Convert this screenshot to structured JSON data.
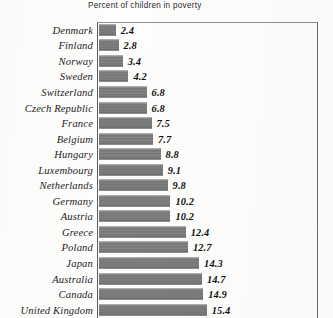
{
  "chart_data": {
    "type": "bar",
    "orientation": "horizontal",
    "title": "Percent of children in poverty",
    "xlabel": "",
    "ylabel": "",
    "grid": false,
    "legend": null,
    "xlim": [
      0,
      17
    ],
    "categories": [
      "Denmark",
      "Finland",
      "Norway",
      "Sweden",
      "Switzerland",
      "Czech Republic",
      "France",
      "Belgium",
      "Hungary",
      "Luxembourg",
      "Netherlands",
      "Germany",
      "Austria",
      "Greece",
      "Poland",
      "Japan",
      "Australia",
      "Canada",
      "United Kingdom"
    ],
    "values": [
      2.4,
      2.8,
      3.4,
      4.2,
      6.8,
      6.8,
      7.5,
      7.7,
      8.8,
      9.1,
      9.8,
      10.2,
      10.2,
      12.4,
      12.7,
      14.3,
      14.7,
      14.9,
      15.4
    ],
    "value_labels": [
      "2.4",
      "2.8",
      "3.4",
      "4.2",
      "6.8",
      "6.8",
      "7.5",
      "7.7",
      "8.8",
      "9.1",
      "9.8",
      "10.2",
      "10.2",
      "12.4",
      "12.7",
      "14.3",
      "14.7",
      "14.9",
      "15.4"
    ],
    "bar_color": "#7c7c7c",
    "axis_color": "#5c5c5c",
    "px_per_unit": 7.0
  }
}
